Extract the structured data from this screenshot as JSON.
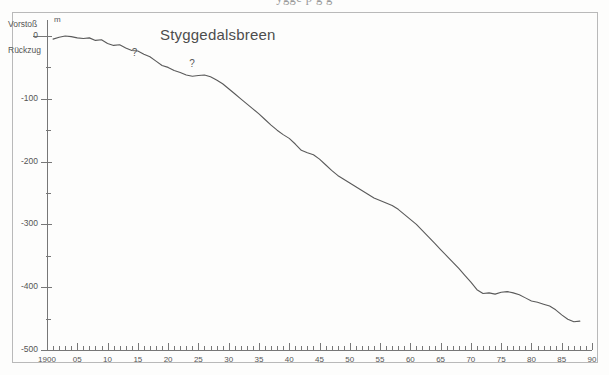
{
  "figure": {
    "clipped_caption_above": "ygge                    p        g      g",
    "title": "Styggedalsbreen"
  },
  "chart_data": {
    "type": "line",
    "title": "Styggedalsbreen",
    "xlabel": "",
    "ylabel": "m",
    "unit_label": "m",
    "direction_labels": {
      "positive": "Vorstoß",
      "zero": "0",
      "negative": "Rückzug"
    },
    "xlim": [
      1900,
      1990
    ],
    "ylim": [
      -500,
      20
    ],
    "grid": false,
    "legend": "none",
    "x_ticks_major": [
      1900,
      1905,
      1910,
      1915,
      1920,
      1925,
      1930,
      1935,
      1940,
      1945,
      1950,
      1955,
      1960,
      1965,
      1970,
      1975,
      1980,
      1985,
      1990
    ],
    "x_tick_labels": [
      "1900",
      "05",
      "10",
      "15",
      "20",
      "25",
      "30",
      "35",
      "40",
      "45",
      "50",
      "55",
      "60",
      "65",
      "70",
      "75",
      "80",
      "85",
      "90"
    ],
    "x_minor_tick_interval": 1,
    "y_ticks_major": [
      0,
      -100,
      -200,
      -300,
      -400,
      -500
    ],
    "y_tick_labels": [
      "0",
      "-100",
      "-200",
      "-300",
      "-400",
      "-500"
    ],
    "y_ticks_minor": [
      -50,
      -150,
      -250,
      -350,
      -450
    ],
    "annotations": [
      {
        "text": "?",
        "x": 1914.5,
        "y": -38
      },
      {
        "text": "?",
        "x": 1924.0,
        "y": -55
      }
    ],
    "series": [
      {
        "name": "Styggedalsbreen cumulative front variation",
        "x": [
          1901,
          1902,
          1903,
          1904,
          1905,
          1906,
          1907,
          1908,
          1909,
          1910,
          1911,
          1912,
          1913,
          1914,
          1915,
          1916,
          1917,
          1918,
          1919,
          1920,
          1921,
          1922,
          1923,
          1924,
          1925,
          1926,
          1927,
          1928,
          1929,
          1930,
          1931,
          1932,
          1933,
          1934,
          1935,
          1936,
          1937,
          1938,
          1939,
          1940,
          1941,
          1942,
          1943,
          1944,
          1945,
          1946,
          1947,
          1948,
          1949,
          1950,
          1951,
          1952,
          1953,
          1954,
          1955,
          1956,
          1957,
          1958,
          1959,
          1960,
          1961,
          1962,
          1963,
          1964,
          1965,
          1966,
          1967,
          1968,
          1969,
          1970,
          1971,
          1972,
          1973,
          1974,
          1975,
          1976,
          1977,
          1978,
          1979,
          1980,
          1981,
          1982,
          1983,
          1984,
          1985,
          1986,
          1987,
          1988
        ],
        "y": [
          -5,
          -2,
          0,
          -1,
          -3,
          -4,
          -3,
          -7,
          -6,
          -12,
          -15,
          -14,
          -19,
          -23,
          -24,
          -29,
          -33,
          -40,
          -47,
          -50,
          -55,
          -58,
          -62,
          -64,
          -63,
          -62,
          -65,
          -70,
          -76,
          -84,
          -92,
          -100,
          -108,
          -116,
          -124,
          -133,
          -142,
          -150,
          -157,
          -163,
          -172,
          -182,
          -186,
          -189,
          -196,
          -205,
          -214,
          -222,
          -228,
          -234,
          -240,
          -246,
          -252,
          -258,
          -262,
          -266,
          -270,
          -276,
          -284,
          -292,
          -300,
          -310,
          -320,
          -330,
          -340,
          -350,
          -360,
          -370,
          -381,
          -392,
          -404,
          -410,
          -409,
          -411,
          -408,
          -407,
          -409,
          -412,
          -417,
          -422,
          -424,
          -427,
          -430,
          -436,
          -444,
          -451,
          -455,
          -454
        ]
      }
    ]
  },
  "colors": {
    "line": "#5a5a5a",
    "axis": "#777777",
    "frame": "#b9b9b9",
    "background": "#fdfdfc",
    "text": "#555555"
  }
}
